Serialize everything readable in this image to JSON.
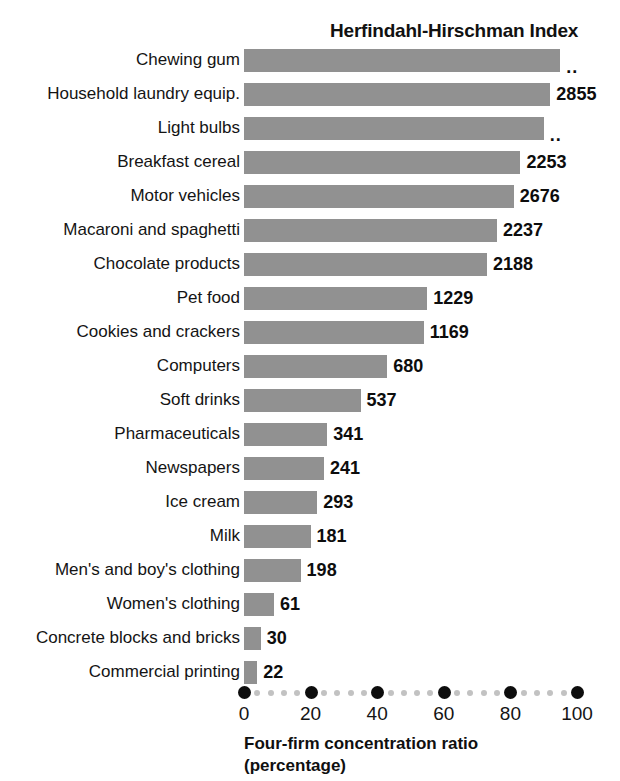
{
  "chart_data": {
    "type": "bar",
    "orientation": "horizontal",
    "title": "Herfindahl-Hirschman Index",
    "xlabel": "Four-firm concentration ratio",
    "xlabel_line2": "(percentage)",
    "ylabel": "",
    "xlim": [
      0,
      100
    ],
    "xticks": [
      0,
      20,
      40,
      60,
      80,
      100
    ],
    "xtick_labels": [
      "0",
      "20",
      "40",
      "60",
      "80",
      "100"
    ],
    "grid": false,
    "legend": null,
    "bar_color": "#919191",
    "categories": [
      "Chewing gum",
      "Household laundry equip.",
      "Light bulbs",
      "Breakfast cereal",
      "Motor vehicles",
      "Macaroni and spaghetti",
      "Chocolate products",
      "Pet food",
      "Cookies and crackers",
      "Computers",
      "Soft drinks",
      "Pharmaceuticals",
      "Newspapers",
      "Ice cream",
      "Milk",
      "Men's and boy's clothing",
      "Women's clothing",
      "Concrete blocks and bricks",
      "Commercial printing"
    ],
    "values": [
      95,
      92,
      90,
      83,
      81,
      76,
      73,
      55,
      54,
      43,
      35,
      25,
      24,
      22,
      20,
      17,
      9,
      5,
      4
    ],
    "value_labels": [
      "..",
      "2855",
      "..",
      "2253",
      "2676",
      "2237",
      "2188",
      "1229",
      "1169",
      "680",
      "537",
      "341",
      "241",
      "293",
      "181",
      "198",
      "61",
      "30",
      "22"
    ],
    "value_label_note": "Labels are Herfindahl-Hirschman Index values; '..' means not available",
    "bars": [
      {
        "category": "Chewing gum",
        "ratio": 95,
        "hhi_label": "..",
        "hhi": null
      },
      {
        "category": "Household laundry equip.",
        "ratio": 92,
        "hhi_label": "2855",
        "hhi": 2855
      },
      {
        "category": "Light bulbs",
        "ratio": 90,
        "hhi_label": "..",
        "hhi": null
      },
      {
        "category": "Breakfast cereal",
        "ratio": 83,
        "hhi_label": "2253",
        "hhi": 2253
      },
      {
        "category": "Motor vehicles",
        "ratio": 81,
        "hhi_label": "2676",
        "hhi": 2676
      },
      {
        "category": "Macaroni and spaghetti",
        "ratio": 76,
        "hhi_label": "2237",
        "hhi": 2237
      },
      {
        "category": "Chocolate products",
        "ratio": 73,
        "hhi_label": "2188",
        "hhi": 2188
      },
      {
        "category": "Pet food",
        "ratio": 55,
        "hhi_label": "1229",
        "hhi": 1229
      },
      {
        "category": "Cookies and crackers",
        "ratio": 54,
        "hhi_label": "1169",
        "hhi": 1169
      },
      {
        "category": "Computers",
        "ratio": 43,
        "hhi_label": "680",
        "hhi": 680
      },
      {
        "category": "Soft drinks",
        "ratio": 35,
        "hhi_label": "537",
        "hhi": 537
      },
      {
        "category": "Pharmaceuticals",
        "ratio": 25,
        "hhi_label": "341",
        "hhi": 341
      },
      {
        "category": "Newspapers",
        "ratio": 24,
        "hhi_label": "241",
        "hhi": 241
      },
      {
        "category": "Ice cream",
        "ratio": 22,
        "hhi_label": "293",
        "hhi": 293
      },
      {
        "category": "Milk",
        "ratio": 20,
        "hhi_label": "181",
        "hhi": 181
      },
      {
        "category": "Men's and boy's clothing",
        "ratio": 17,
        "hhi_label": "198",
        "hhi": 198
      },
      {
        "category": "Women's clothing",
        "ratio": 9,
        "hhi_label": "61",
        "hhi": 61
      },
      {
        "category": "Concrete blocks and bricks",
        "ratio": 5,
        "hhi_label": "30",
        "hhi": 30
      },
      {
        "category": "Commercial printing",
        "ratio": 4,
        "hhi_label": "22",
        "hhi": 22
      }
    ]
  }
}
